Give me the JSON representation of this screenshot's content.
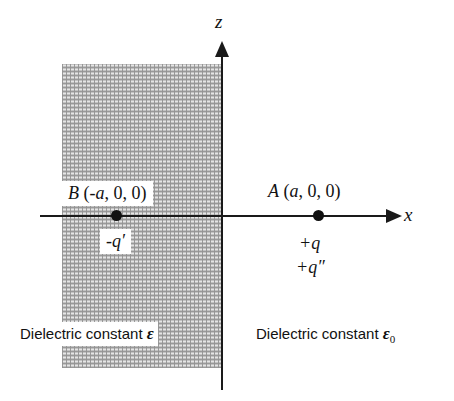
{
  "figure": {
    "background_color": "#ffffff",
    "line_color": "#1a1a1a",
    "hatch_color": "#a8a8a8"
  },
  "axes": {
    "x_label": "x",
    "z_label": "z",
    "origin_label": ""
  },
  "regions": {
    "left": {
      "caption_text": "Dielectric constant",
      "symbol": "ε",
      "subscript": ""
    },
    "right": {
      "caption_text": "Dielectric constant",
      "symbol": "ε",
      "subscript": "0"
    }
  },
  "points": {
    "b": {
      "name": "B",
      "coordinates": "(-a, 0, 0)",
      "coord_open": "(",
      "coord_neg": "-a",
      "coord_rest": ", 0, 0)",
      "charges": [
        "-q′"
      ]
    },
    "a": {
      "name": "A",
      "coordinates": "(a, 0, 0)",
      "coord_open": "(",
      "coord_var": "a",
      "coord_rest": ", 0, 0)",
      "charges": [
        "+q",
        "+q″"
      ]
    }
  },
  "chart_data": {
    "type": "diagram",
    "xlabel": "x",
    "ylabel": "z",
    "annotations": [
      "B (-a, 0, 0)",
      "-q′",
      "A (a, 0, 0)",
      "+q",
      "+q″",
      "Dielectric constant ε",
      "Dielectric constant ε₀"
    ],
    "elements": [
      {
        "kind": "region",
        "label": "Dielectric constant ε",
        "x_range": [
          -1.0,
          0.0
        ],
        "fill": "hatched"
      },
      {
        "kind": "region",
        "label": "Dielectric constant ε₀",
        "x_range": [
          0.0,
          1.0
        ],
        "fill": "none"
      },
      {
        "kind": "point",
        "label": "B",
        "x": -1,
        "y": 0,
        "z": 0,
        "charge": "-q′"
      },
      {
        "kind": "point",
        "label": "A",
        "x": 1,
        "y": 0,
        "z": 0,
        "charge": "+q, +q″"
      }
    ]
  }
}
